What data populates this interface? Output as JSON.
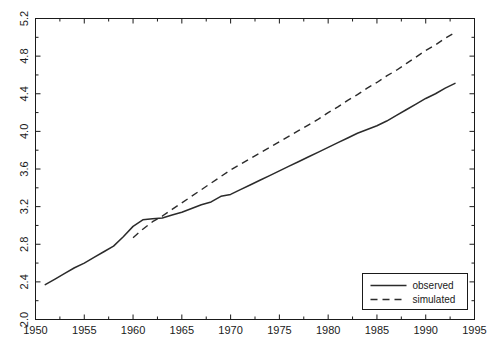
{
  "chart_data": {
    "type": "line",
    "title": "",
    "subtitle": "",
    "xlabel": "",
    "ylabel": "",
    "xlim": [
      1950,
      1995
    ],
    "ylim": [
      2.0,
      5.2
    ],
    "xticks": [
      1950,
      1955,
      1960,
      1965,
      1970,
      1975,
      1980,
      1985,
      1990,
      1995
    ],
    "xtick_labels": [
      "1950",
      "1955",
      "1960",
      "1965",
      "1970",
      "1975",
      "1980",
      "1985",
      "1990",
      "1995"
    ],
    "yticks": [
      2.0,
      2.4,
      2.8,
      3.2,
      3.6,
      4.0,
      4.4,
      4.8,
      5.2
    ],
    "ytick_labels": [
      "2.0",
      "2.4",
      "2.8",
      "3.2",
      "3.6",
      "4.0",
      "4.4",
      "4.8",
      "5.2"
    ],
    "yminor_step": 0.2,
    "xminor_step": 2.5,
    "grid": false,
    "legend_position": "bottom-right",
    "series": [
      {
        "name": "observed",
        "style": "solid",
        "color": "#2b2b2b",
        "x": [
          1951,
          1952,
          1953,
          1954,
          1955,
          1956,
          1957,
          1958,
          1959,
          1960,
          1961,
          1962,
          1963,
          1964,
          1965,
          1966,
          1967,
          1968,
          1969,
          1970,
          1971,
          1972,
          1973,
          1974,
          1975,
          1976,
          1977,
          1978,
          1979,
          1980,
          1981,
          1982,
          1983,
          1984,
          1985,
          1986,
          1987,
          1988,
          1989,
          1990,
          1991,
          1992,
          1993
        ],
        "values": [
          2.37,
          2.43,
          2.49,
          2.55,
          2.6,
          2.66,
          2.72,
          2.78,
          2.88,
          2.99,
          3.06,
          3.07,
          3.08,
          3.11,
          3.14,
          3.18,
          3.22,
          3.25,
          3.31,
          3.33,
          3.38,
          3.43,
          3.48,
          3.53,
          3.58,
          3.63,
          3.68,
          3.73,
          3.78,
          3.83,
          3.88,
          3.93,
          3.98,
          4.02,
          4.06,
          4.11,
          4.17,
          4.23,
          4.29,
          4.35,
          4.4,
          4.46,
          4.51
        ]
      },
      {
        "name": "simulated",
        "style": "dashed",
        "color": "#2b2b2b",
        "x": [
          1960,
          1961,
          1962,
          1963,
          1964,
          1965,
          1966,
          1967,
          1968,
          1969,
          1970,
          1971,
          1972,
          1973,
          1974,
          1975,
          1976,
          1977,
          1978,
          1979,
          1980,
          1981,
          1982,
          1983,
          1984,
          1985,
          1986,
          1987,
          1988,
          1989,
          1990,
          1991,
          1992,
          1993
        ],
        "values": [
          2.87,
          2.96,
          3.04,
          3.1,
          3.17,
          3.24,
          3.31,
          3.38,
          3.45,
          3.52,
          3.59,
          3.65,
          3.71,
          3.77,
          3.83,
          3.89,
          3.95,
          4.01,
          4.07,
          4.13,
          4.2,
          4.26,
          4.33,
          4.39,
          4.46,
          4.52,
          4.59,
          4.65,
          4.72,
          4.79,
          4.86,
          4.92,
          4.99,
          5.05
        ]
      }
    ],
    "legend": [
      {
        "label": "observed",
        "style": "solid"
      },
      {
        "label": "simulated",
        "style": "dashed"
      }
    ]
  }
}
